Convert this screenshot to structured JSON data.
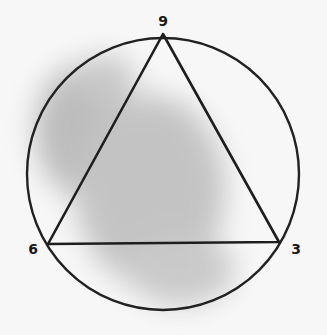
{
  "diagram": {
    "colors": {
      "background": "#f7f7f7",
      "stroke": "#222222",
      "smudge": "#9a9a9a"
    },
    "circle": {
      "cx": 163,
      "cy": 174,
      "r": 136
    },
    "triangle": {
      "vertices": [
        {
          "id": "top",
          "x": 163,
          "y": 34,
          "label": "9"
        },
        {
          "id": "bottom-left",
          "x": 48,
          "y": 244,
          "label": "6"
        },
        {
          "id": "bottom-right",
          "x": 279,
          "y": 242,
          "label": "3"
        }
      ]
    },
    "labels": {
      "top": "9",
      "bottom_left": "6",
      "bottom_right": "3"
    }
  }
}
